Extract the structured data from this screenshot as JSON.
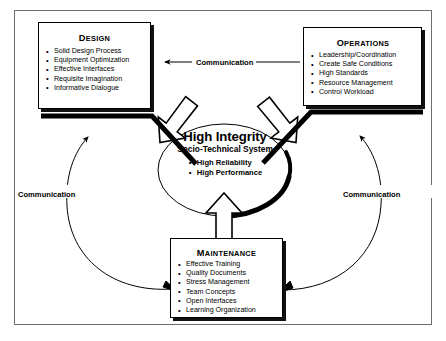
{
  "diagram": {
    "title": "High Integrity Socio-Technical System",
    "frame_color": "#6d6d6d",
    "outline_color": "#000000",
    "shadow_color": "#111111",
    "background": "#ffffff"
  },
  "hub": {
    "heading": "High Integrity",
    "subheading": "Socio-Technical System",
    "attributes": [
      "High Reliability",
      "High Performance"
    ]
  },
  "boxes": [
    {
      "id": "design",
      "title_cap": "D",
      "title_rest": "ESIGN",
      "title_plain": "Design",
      "items": [
        "Solid Design Process",
        "Equipment Optimization",
        "Effective Interfaces",
        "Requisite Imagination",
        "Informative Dialogue"
      ]
    },
    {
      "id": "operations",
      "title_cap": "O",
      "title_rest": "PERATIONS",
      "title_plain": "Operations",
      "items": [
        "Leadership/Coordination",
        "Create Safe Conditions",
        "High Standards",
        "Resource Management",
        "Control Workload"
      ]
    },
    {
      "id": "maintenance",
      "title_cap": "M",
      "title_rest": "AINTENANCE",
      "title_plain": "Maintenance",
      "items": [
        "Effective Training",
        "Quality Documents",
        "Stress Management",
        "Team Concepts",
        "Open Interfaces",
        "Learning Organization"
      ]
    }
  ],
  "communication_labels": [
    {
      "id": "top",
      "text": "Communication"
    },
    {
      "id": "left",
      "text": "Communication"
    },
    {
      "id": "right",
      "text": "Communication"
    }
  ],
  "caption": {
    "text": ""
  }
}
